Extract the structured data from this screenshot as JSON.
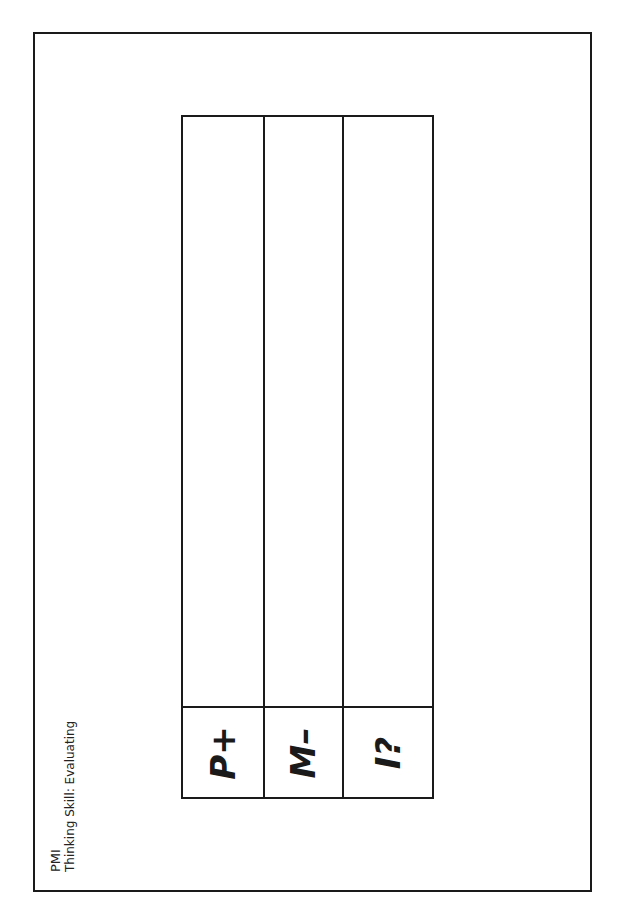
{
  "document": {
    "title": "PMI",
    "subtitle": "Thinking Skill: Evaluating"
  },
  "table": {
    "columns": [
      {
        "label": "P+",
        "meaning": "plus"
      },
      {
        "label": "M–",
        "meaning": "minus"
      },
      {
        "label": "I?",
        "meaning": "interesting"
      }
    ]
  }
}
